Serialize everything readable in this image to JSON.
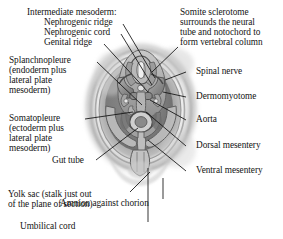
{
  "figure": {
    "type": "anatomical-diagram",
    "background_color": "#ffffff",
    "text_color": "#141414",
    "leader_line_color": "#111111"
  },
  "labels_left": [
    {
      "id": "intermediate-mesoderm-group",
      "lines": [
        "Intermediate mesoderm:",
        "   Nephrogenic ridge",
        "   Nephrogenic cord",
        "   Genital ridge"
      ]
    },
    {
      "id": "splanchnopleure",
      "lines": [
        "Splanchnopleure",
        "(endoderm plus",
        "lateral plate",
        "mesoderm)"
      ]
    },
    {
      "id": "somatopleure",
      "lines": [
        "Somatopleure",
        "(ectoderm plus",
        "lateral plate",
        "mesoderm)"
      ]
    },
    {
      "id": "gut-tube",
      "lines": [
        "Gut tube"
      ]
    },
    {
      "id": "yolk-sac",
      "lines": [
        "Yolk sac (stalk just out",
        "of the plane of section)"
      ]
    }
  ],
  "labels_right": [
    {
      "id": "somite-sclerotome",
      "lines": [
        "Somite sclerotome",
        "surrounds the neural",
        "tube and notochord to",
        "form vertebral column"
      ]
    },
    {
      "id": "spinal-nerve",
      "lines": [
        "Spinal nerve"
      ]
    },
    {
      "id": "dermomyotome",
      "lines": [
        "Dermomyotome"
      ]
    },
    {
      "id": "aorta",
      "lines": [
        "Aorta"
      ]
    },
    {
      "id": "dorsal-mesentery",
      "lines": [
        "Dorsal mesentery"
      ]
    },
    {
      "id": "ventral-mesentery",
      "lines": [
        "Ventral mesentery"
      ]
    },
    {
      "id": "amnion-against-chorion",
      "lines": [
        "Amnion against chorion"
      ]
    },
    {
      "id": "umbilical-cord",
      "lines": [
        "Umbilical cord"
      ]
    }
  ],
  "text": {
    "intermediate_mesoderm_l1": "Intermediate mesoderm:",
    "intermediate_mesoderm_l2": "Nephrogenic ridge",
    "intermediate_mesoderm_l3": "Nephrogenic cord",
    "intermediate_mesoderm_l4": "Genital ridge",
    "splanchnopleure_l1": "Splanchnopleure",
    "splanchnopleure_l2": "(endoderm plus",
    "splanchnopleure_l3": "lateral plate",
    "splanchnopleure_l4": "mesoderm)",
    "somatopleure_l1": "Somatopleure",
    "somatopleure_l2": "(ectoderm plus",
    "somatopleure_l3": "lateral plate",
    "somatopleure_l4": "mesoderm)",
    "gut_tube": "Gut tube",
    "yolk_sac_l1": "Yolk sac (stalk just out",
    "yolk_sac_l2": "of the plane of section)",
    "somite_l1": "Somite sclerotome",
    "somite_l2": "surrounds the neural",
    "somite_l3": "tube and notochord to",
    "somite_l4": "form vertebral column",
    "spinal_nerve": "Spinal nerve",
    "dermomyotome": "Dermomyotome",
    "aorta": "Aorta",
    "dorsal_mesentery": "Dorsal mesentery",
    "ventral_mesentery": "Ventral mesentery",
    "amnion": "Amnion against chorion",
    "umbilical_cord": "Umbilical cord"
  }
}
